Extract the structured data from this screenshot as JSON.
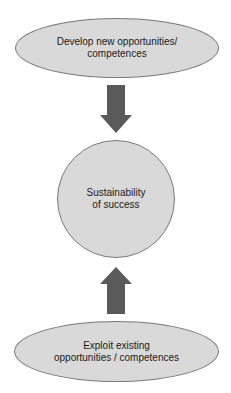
{
  "diagram": {
    "top_node": {
      "label": "Develop new opportunities/\ncompetences",
      "shape": "ellipse"
    },
    "center_node": {
      "label": "Sustainability\nof success",
      "shape": "circle"
    },
    "bottom_node": {
      "label": "Exploit existing\nopportunities / competences",
      "shape": "ellipse"
    },
    "arrows": [
      {
        "from": "top_node",
        "to": "center_node",
        "direction": "down",
        "icon": "arrow-down-icon"
      },
      {
        "from": "bottom_node",
        "to": "center_node",
        "direction": "up",
        "icon": "arrow-up-icon"
      }
    ],
    "colors": {
      "node_fill": "#d9d9d9",
      "node_border": "#7a7a7a",
      "arrow_fill": "#5a5a5a",
      "text": "#1a1a1a",
      "background": "#ffffff"
    }
  }
}
